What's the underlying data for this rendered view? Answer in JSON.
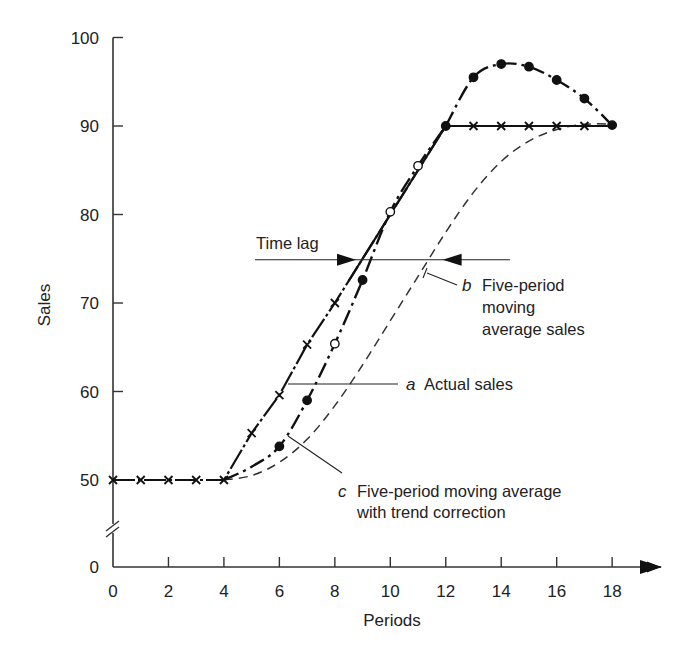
{
  "chart_data": {
    "type": "line",
    "title": "",
    "xlabel": "Periods",
    "ylabel": "Sales",
    "xlim": [
      0,
      19
    ],
    "ylim": [
      0,
      100
    ],
    "y_axis_break": {
      "between": [
        0,
        50
      ]
    },
    "x_ticks": [
      0,
      2,
      4,
      6,
      8,
      10,
      12,
      14,
      16,
      18
    ],
    "y_ticks": [
      0,
      50,
      60,
      70,
      80,
      90,
      100
    ],
    "grid": false,
    "legend": "none (inline annotations)",
    "series": [
      {
        "name": "a Actual sales",
        "marker": "x",
        "style": "dash-dot",
        "x": [
          0,
          1,
          2,
          3,
          4,
          5,
          6,
          7,
          8,
          9,
          10,
          11,
          12,
          13,
          14,
          15,
          16,
          17,
          18
        ],
        "values": [
          50,
          50,
          50,
          50,
          50,
          55.3,
          59.6,
          65.3,
          70,
          75,
          80,
          85,
          90,
          90,
          90,
          90,
          90,
          90,
          90
        ]
      },
      {
        "name": "b Five-period moving average sales",
        "marker": "none",
        "style": "dashed",
        "x": [
          4,
          5,
          6,
          7,
          8,
          9,
          10,
          11,
          12,
          13,
          14,
          15,
          16,
          17,
          18
        ],
        "values": [
          50,
          50.5,
          52,
          54.6,
          58.4,
          63,
          68,
          73,
          78,
          82.5,
          86,
          88.3,
          89.6,
          90.2,
          90.2
        ]
      },
      {
        "name": "c Five-period moving average with trend correction",
        "marker": "filled/open circle",
        "style": "dash-dot",
        "x": [
          4,
          5,
          6,
          7,
          8,
          9,
          10,
          11,
          12,
          13,
          14,
          15,
          16,
          17,
          18
        ],
        "values": [
          50,
          51.5,
          53.8,
          59,
          65.4,
          72.6,
          80.3,
          85.5,
          90,
          95.5,
          97,
          96.7,
          95.2,
          93.1,
          90.1
        ],
        "open_points_x": [
          8,
          10,
          11
        ]
      }
    ],
    "annotations": [
      {
        "text": "Time lag",
        "type": "double-arrow",
        "y": 75,
        "x_from": 5,
        "x_to": 14.3
      },
      {
        "letter": "a",
        "text": "Actual sales"
      },
      {
        "letter": "b",
        "text": [
          "Five-period",
          "moving",
          "average sales"
        ]
      },
      {
        "letter": "c",
        "text": [
          "Five-period moving average",
          "with trend correction"
        ]
      }
    ]
  }
}
